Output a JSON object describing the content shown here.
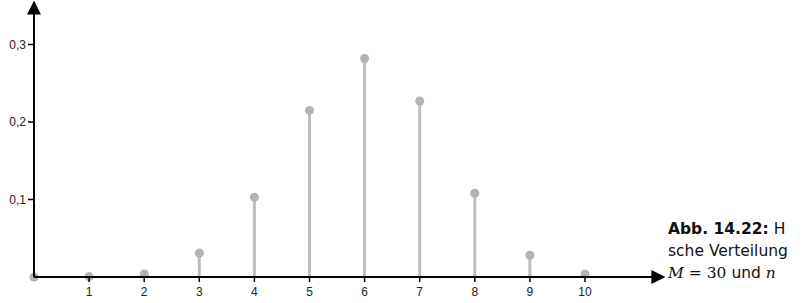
{
  "chart_data": {
    "type": "stem",
    "title": "",
    "xlabel": "",
    "ylabel": "",
    "x": [
      0,
      1,
      2,
      3,
      4,
      5,
      6,
      7,
      8,
      9,
      10
    ],
    "values": [
      0.0,
      0.0005,
      0.004,
      0.031,
      0.103,
      0.215,
      0.282,
      0.227,
      0.108,
      0.028,
      0.004
    ],
    "x_tick_labels": [
      "1",
      "2",
      "3",
      "4",
      "5",
      "6",
      "7",
      "8",
      "9",
      "10"
    ],
    "y_ticks": [
      0.1,
      0.2,
      0.3
    ],
    "y_tick_labels": [
      "0,1",
      "0,2",
      "0,3"
    ],
    "xlim": [
      0,
      11.5
    ],
    "ylim": [
      0,
      0.357
    ],
    "grid": false,
    "legend": null,
    "colors": {
      "stem": "#bdbdbd",
      "marker": "#b3b3b3",
      "axis": "#000000"
    }
  },
  "caption": {
    "label": "Abb. 14.22:",
    "line1_rest": " H",
    "line2": "sche Verteilung",
    "line3_math_M": "M",
    "line3_eq": " = 30",
    "line3_und": " und ",
    "line3_n": "n"
  }
}
